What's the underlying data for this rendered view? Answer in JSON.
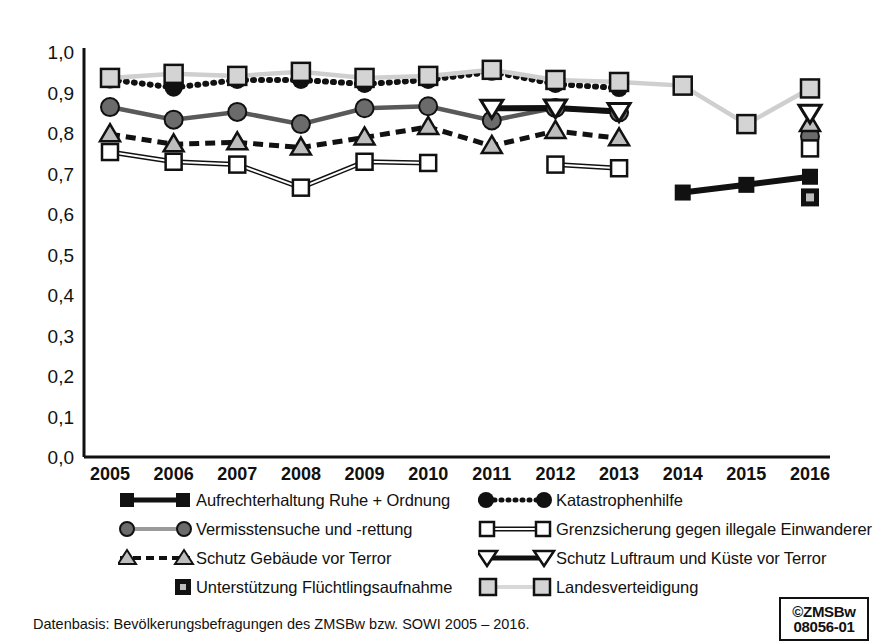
{
  "chart_data": {
    "type": "line",
    "title": "",
    "xlabel": "",
    "ylabel": "",
    "grid": false,
    "legend_position": "bottom",
    "x": [
      "2005",
      "2006",
      "2007",
      "2008",
      "2009",
      "2010",
      "2011",
      "2012",
      "2013",
      "2014",
      "2015",
      "2016"
    ],
    "ylim": [
      0.0,
      1.0
    ],
    "ytick_labels": [
      "1,0",
      "0,9",
      "0,8",
      "0,7",
      "0,6",
      "0,5",
      "0,4",
      "0,3",
      "0,2",
      "0,1",
      "0,0"
    ],
    "ytick_values": [
      1.0,
      0.9,
      0.8,
      0.7,
      0.6,
      0.5,
      0.4,
      0.3,
      0.2,
      0.1,
      0.0
    ],
    "series": [
      {
        "name": "Aufrechterhaltung Ruhe + Ordnung",
        "marker": "square-filled",
        "line": "solid-thick-black",
        "color": "#111111",
        "values": [
          null,
          null,
          null,
          null,
          null,
          null,
          null,
          null,
          null,
          0.653,
          0.672,
          0.692
        ]
      },
      {
        "name": "Katastrophenhilfe",
        "marker": "circle-filled",
        "line": "dotted-thick-black",
        "color": "#111111",
        "values": [
          0.932,
          0.912,
          0.931,
          0.931,
          0.921,
          0.931,
          0.951,
          0.921,
          0.911,
          null,
          null,
          0.912
        ]
      },
      {
        "name": "Vermisstensuche und -rettung",
        "marker": "circle-gray",
        "line": "solid-gray",
        "color": "#595959",
        "values": [
          0.864,
          0.833,
          0.852,
          0.822,
          0.861,
          0.866,
          0.831,
          0.862,
          0.851,
          null,
          null,
          0.792
        ]
      },
      {
        "name": "Grenzsicherung gegen illegale Einwanderer",
        "marker": "square-open",
        "line": "double-white-black",
        "color": "#111111",
        "values": [
          0.753,
          0.729,
          0.722,
          0.665,
          0.729,
          0.726,
          null,
          0.722,
          0.713,
          null,
          null,
          0.762
        ]
      },
      {
        "name": "Schutz Gebäude vor Terror",
        "marker": "triangle-up-gray",
        "line": "dashed-thick-black",
        "color": "#111111",
        "values": [
          0.797,
          0.772,
          0.777,
          0.764,
          0.789,
          0.815,
          0.768,
          0.805,
          0.787,
          null,
          null,
          0.822
        ]
      },
      {
        "name": "Schutz Luftraum und Küste vor Terror",
        "marker": "triangle-down-open",
        "line": "solid-thick-black",
        "color": "#111111",
        "values": [
          null,
          null,
          null,
          null,
          null,
          null,
          0.861,
          0.862,
          0.853,
          null,
          null,
          0.849
        ]
      },
      {
        "name": "Unterstützung Flüchtlingsaufnahme",
        "marker": "square-filled-dot",
        "line": "none",
        "color": "#111111",
        "values": [
          null,
          null,
          null,
          null,
          null,
          null,
          null,
          null,
          null,
          null,
          null,
          0.641
        ]
      },
      {
        "name": "Landesverteidigung",
        "marker": "square-lightgray",
        "line": "solid-lightgray",
        "color": "#c8c8c8",
        "values": [
          0.936,
          0.946,
          0.941,
          0.951,
          0.936,
          0.941,
          0.956,
          0.931,
          0.926,
          0.917,
          0.822,
          0.91
        ]
      }
    ]
  },
  "axis": {
    "x_labels": [
      "2005",
      "2006",
      "2007",
      "2008",
      "2009",
      "2010",
      "2011",
      "2012",
      "2013",
      "2014",
      "2015",
      "2016"
    ],
    "y_labels": [
      "1,0",
      "0,9",
      "0,8",
      "0,7",
      "0,6",
      "0,5",
      "0,4",
      "0,3",
      "0,2",
      "0,1",
      "0,0"
    ]
  },
  "legend": {
    "left": [
      {
        "label": "Aufrechterhaltung Ruhe + Ordnung",
        "key": "square-filled-solid-black"
      },
      {
        "label": "Vermisstensuche und -rettung",
        "key": "circle-gray-solid-gray"
      },
      {
        "label": "Schutz Gebäude vor Terror",
        "key": "triangle-up-dashed-black"
      },
      {
        "label": "Unterstützung Flüchtlingsaufnahme",
        "key": "square-dot-no-line"
      }
    ],
    "right": [
      {
        "label": "Katastrophenhilfe",
        "key": "circle-filled-dotted-black"
      },
      {
        "label": "Grenzsicherung gegen illegale Einwanderer",
        "key": "square-open-double-line"
      },
      {
        "label": "Schutz Luftraum und Küste vor Terror",
        "key": "triangle-down-solid-black"
      },
      {
        "label": "Landesverteidigung",
        "key": "square-lightgray-solid-lightgray"
      }
    ]
  },
  "footer": {
    "source": "Datenbasis: Bevölkerungsbefragungen des ZMSBw bzw. SOWI 2005 – 2016."
  },
  "stamp": {
    "line1": "©ZMSBw",
    "line2": "08056-01"
  }
}
